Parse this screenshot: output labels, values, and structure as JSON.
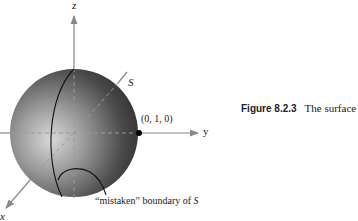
{
  "figure": {
    "axes": {
      "x_label": "x",
      "y_label": "y",
      "z_label": "z"
    },
    "surface_label": "S",
    "point_label": "(0, 1, 0)",
    "boundary_label_prefix": "“mistaken” boundary of ",
    "boundary_label_var": "S",
    "colors": {
      "sphere_light": "#d8d8d8",
      "sphere_dark": "#3a3a3a",
      "axis": "#888888",
      "line": "#111111"
    }
  },
  "caption": {
    "number": "Figure 8.2.3",
    "text": "The surface"
  }
}
